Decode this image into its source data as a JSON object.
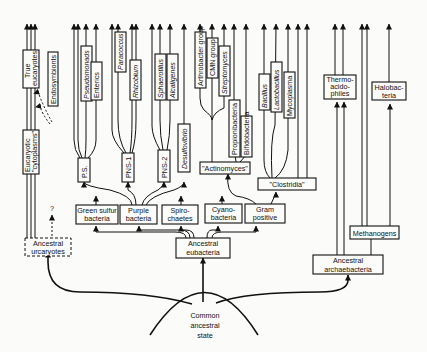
{
  "diagram": {
    "type": "phylogenetic-tree",
    "root": {
      "label_lines": [
        "Common",
        "ancestral",
        "state"
      ]
    },
    "ancestral_groups": {
      "urcaryotes": [
        "Ancestral",
        "urcaryotes"
      ],
      "eubacteria": [
        "Ancestral",
        "eubacteria"
      ],
      "archaebacteria": [
        "Ancestral",
        "archaebacteria"
      ]
    },
    "eukaryote_line": {
      "cytoplasm": [
        "Eucaryotic",
        "\"cytoplasms\""
      ],
      "true_eucaryotes": [
        "True",
        "eucaryotes"
      ],
      "endosymbionts": "Endosymbionts",
      "question_mark": "?"
    },
    "eubacterial_phyla": {
      "green_sulfur": [
        "Green sulfur",
        "bacteria"
      ],
      "purple": [
        "Purple",
        "bacteria"
      ],
      "spirochaetes": [
        "Spiro-",
        "chaetes"
      ],
      "cyanobacteria": [
        "Cyano-",
        "bacteria"
      ],
      "gram_positive": [
        "Gram",
        "positive"
      ]
    },
    "purple_subgroups": {
      "ps": "P.S.",
      "pns1": "PNS-1",
      "pns2": "PNS-2",
      "desulfovibrio": "Desulfovibrio"
    },
    "ps_members": [
      "Pseudomonads",
      "Enterics"
    ],
    "pns1_members": [
      "Paracoccus",
      "Rhizobium"
    ],
    "pns2_members": [
      "Sphaerotilus",
      "Alcaligenes"
    ],
    "gram_positive_subgroups": {
      "actinomyces": "\"Actinomyces\"",
      "clostridia": "\"Clostridia\""
    },
    "actinomyces_members": [
      "Arthrobacter group",
      "CMN group",
      "Streptomyces",
      "Propionibacteria",
      "Bifidobacteria"
    ],
    "clostridia_members": [
      "Bacillus",
      "Lactobacillus",
      "Mycoplasma"
    ],
    "archaebacteria_groups": {
      "methanogens": "Methanogens",
      "thermoacidophiles": [
        "Thermo-",
        "acido-",
        "philes"
      ],
      "halobacteria": [
        "Halobac-",
        "teria"
      ]
    }
  }
}
